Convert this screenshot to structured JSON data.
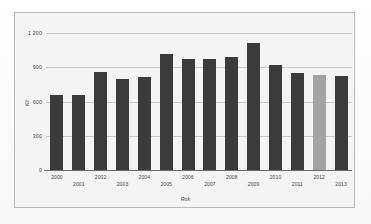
{
  "chart_data": {
    "type": "bar",
    "title": "",
    "xlabel": "Rok",
    "ylabel": "Kč",
    "categories": [
      "2000",
      "2001",
      "2002",
      "2003",
      "2004",
      "2005",
      "2006",
      "2007",
      "2008",
      "2009",
      "2010",
      "2011",
      "2012",
      "2013"
    ],
    "values": [
      660,
      660,
      860,
      800,
      815,
      1020,
      975,
      975,
      990,
      1110,
      920,
      850,
      830,
      825
    ],
    "ylim": [
      0,
      1200
    ],
    "yticks": [
      0,
      300,
      600,
      900,
      1200
    ],
    "ytick_labels": [
      "0",
      "300",
      "600",
      "900",
      "1 200"
    ],
    "grid": true,
    "legend": "none",
    "bar_color": "#3b3b3b",
    "highlight_color": "#a3a3a3",
    "highlighted_category": "2012",
    "axis_color": "#6b6b6b",
    "gridline_color": "#c9c9c9",
    "plot_background": "#f4f4f4"
  }
}
